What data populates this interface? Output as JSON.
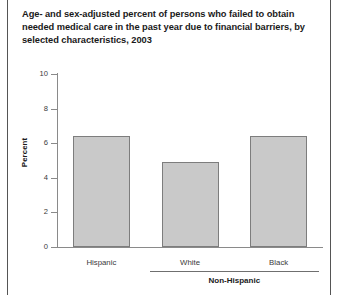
{
  "chart_data": {
    "type": "bar",
    "title": "Age- and sex-adjusted percent of persons who failed to obtain needed medical care in the past year due to financial barriers, by selected characteristics, 2003",
    "categories": [
      "Hispanic",
      "White",
      "Black"
    ],
    "values": [
      6.4,
      4.9,
      6.4
    ],
    "series": [
      {
        "name": "Percent",
        "values": [
          6.4,
          4.9,
          6.4
        ]
      }
    ],
    "xlabel": "",
    "ylabel": "Percent",
    "ylim": [
      0,
      10
    ],
    "ytick_values": [
      10,
      8,
      6,
      4,
      2,
      0
    ],
    "ytick_labels": [
      "10",
      "8",
      "6",
      "4",
      "2",
      "0"
    ],
    "grid": false,
    "legend": "none",
    "group_brackets": [
      {
        "label": "Non-Hispanic",
        "categories": [
          "White",
          "Black"
        ]
      }
    ],
    "bar_color": "#c9c9c9",
    "bar_edge_color": "#7d7d7d",
    "axis_color": "#8a8a8a",
    "text_color": "#1a1a1a"
  }
}
